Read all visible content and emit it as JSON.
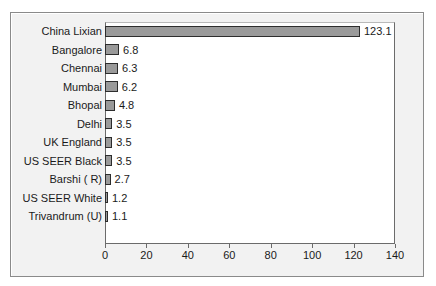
{
  "chart_data": {
    "type": "bar",
    "orientation": "horizontal",
    "title": "",
    "subtitle": "",
    "xlabel": "",
    "ylabel": "",
    "xlim": [
      0,
      140
    ],
    "xticks": [
      0,
      20,
      40,
      60,
      80,
      100,
      120,
      140
    ],
    "grid": false,
    "legend": null,
    "bar_color": "#9a9a9a",
    "bar_border_color": "#2d2d2d",
    "plot_background": "#ffffff",
    "figure_background": "#f2f2f2",
    "categories": [
      "China Lixian",
      "Bangalore",
      "Chennai",
      "Mumbai",
      "Bhopal",
      "Delhi",
      "UK England",
      "US SEER Black",
      "Barshi ( R)",
      "US SEER White",
      "Trivandrum (U)"
    ],
    "values": [
      123.1,
      6.8,
      6.3,
      6.2,
      4.8,
      3.5,
      3.5,
      3.5,
      2.7,
      1.2,
      1.1
    ],
    "data_labels": [
      "123.1",
      "6.8",
      "6.3",
      "6.2",
      "4.8",
      "3.5",
      "3.5",
      "3.5",
      "2.7",
      "1.2",
      "1.1"
    ],
    "xtick_labels": [
      "0",
      "20",
      "40",
      "60",
      "80",
      "100",
      "120",
      "140"
    ]
  }
}
